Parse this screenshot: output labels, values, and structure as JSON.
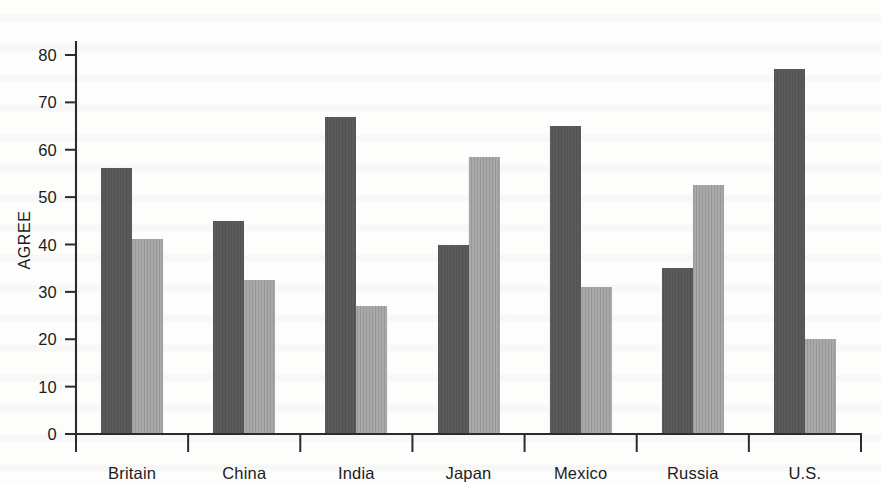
{
  "chart_data": {
    "type": "bar",
    "title": "",
    "xlabel": "",
    "ylabel": "AGREE",
    "ylim": [
      0,
      80
    ],
    "yticks": [
      0,
      10,
      20,
      30,
      40,
      50,
      60,
      70,
      80
    ],
    "ytick_labels": [
      "0",
      "10",
      "20",
      "30",
      "40",
      "50",
      "60",
      "70",
      "80"
    ],
    "grid": false,
    "legend": "none",
    "categories": [
      "Britain",
      "China",
      "India",
      "Japan",
      "Mexico",
      "Russia",
      "U.S."
    ],
    "series": [
      {
        "name": "series-1-dark",
        "color": "#5b5b5b",
        "values": [
          56.2,
          45.0,
          67.0,
          40.0,
          65.0,
          35.0,
          77.0
        ]
      },
      {
        "name": "series-2-light",
        "color": "#a9a9a9",
        "values": [
          41.2,
          32.5,
          27.0,
          58.5,
          31.0,
          52.5,
          20.0
        ]
      }
    ]
  },
  "axes": {
    "y_axis_label": "AGREE",
    "y_tick_labels": [
      "80",
      "70",
      "60",
      "50",
      "40",
      "30",
      "20",
      "10",
      "0"
    ],
    "x_tick_labels": [
      "Britain",
      "China",
      "India",
      "Japan",
      "Mexico",
      "Russia",
      "U.S."
    ]
  },
  "colors": {
    "series_dark": "#5b5b5b",
    "series_light": "#a9a9a9",
    "axis": "#2b2b2b",
    "background": "#fdfdfc",
    "text": "#1c1c1c"
  }
}
